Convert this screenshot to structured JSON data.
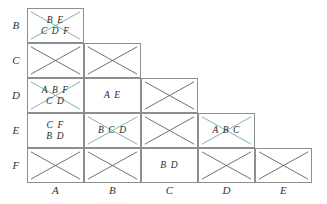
{
  "figure": {
    "type": "triangular-matrix",
    "row_labels": [
      "B",
      "C",
      "D",
      "E",
      "F"
    ],
    "col_labels": [
      "A",
      "B",
      "C",
      "D",
      "E"
    ],
    "colors": {
      "cell_border": "#8e8e8e",
      "grid_outline": "#808080",
      "empty_cross": "#595959",
      "text_cross": "#6aa9a0",
      "text": "#2b2b2b",
      "label": "#333333",
      "background": "#ffffff"
    },
    "cells": [
      {
        "row": "B",
        "col": "A",
        "lines": [
          "B E",
          "C D F"
        ],
        "crossed": true,
        "cross_color": "#6aa9a0"
      },
      {
        "row": "C",
        "col": "A",
        "lines": [],
        "crossed": true,
        "cross_color": "#595959"
      },
      {
        "row": "C",
        "col": "B",
        "lines": [],
        "crossed": true,
        "cross_color": "#595959"
      },
      {
        "row": "D",
        "col": "A",
        "lines": [
          "A B F",
          "C D"
        ],
        "crossed": true,
        "cross_color": "#6aa9a0"
      },
      {
        "row": "D",
        "col": "B",
        "lines": [
          "A E"
        ],
        "crossed": false,
        "cross_color": ""
      },
      {
        "row": "D",
        "col": "C",
        "lines": [],
        "crossed": true,
        "cross_color": "#595959"
      },
      {
        "row": "E",
        "col": "A",
        "lines": [
          "C F",
          "B D"
        ],
        "crossed": false,
        "cross_color": ""
      },
      {
        "row": "E",
        "col": "B",
        "lines": [
          "B C D"
        ],
        "crossed": true,
        "cross_color": "#6aa9a0"
      },
      {
        "row": "E",
        "col": "C",
        "lines": [],
        "crossed": true,
        "cross_color": "#595959"
      },
      {
        "row": "E",
        "col": "D",
        "lines": [
          "A B C"
        ],
        "crossed": true,
        "cross_color": "#6aa9a0"
      },
      {
        "row": "F",
        "col": "A",
        "lines": [],
        "crossed": true,
        "cross_color": "#595959"
      },
      {
        "row": "F",
        "col": "B",
        "lines": [],
        "crossed": true,
        "cross_color": "#595959"
      },
      {
        "row": "F",
        "col": "C",
        "lines": [
          "B D"
        ],
        "crossed": false,
        "cross_color": ""
      },
      {
        "row": "F",
        "col": "D",
        "lines": [],
        "crossed": true,
        "cross_color": "#595959"
      },
      {
        "row": "F",
        "col": "E",
        "lines": [],
        "crossed": true,
        "cross_color": "#595959"
      }
    ]
  }
}
